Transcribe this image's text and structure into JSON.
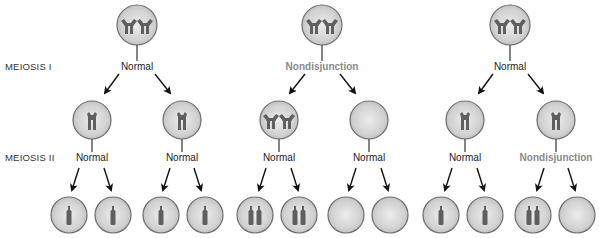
{
  "diagram": {
    "title": "",
    "stage_labels": {
      "meiosis_1": "MEIOSIS I",
      "meiosis_2": "MEIOSIS II"
    },
    "colors": {
      "cell_fill": "#cfcfcf",
      "cell_highlight": "#ececec",
      "cell_border": "#6e6e6e",
      "chromosome": "#5f5f5f",
      "nondisjunction_text": "#8a8a8a",
      "normal_text": "#222222",
      "arrow": "#111111"
    },
    "scenarios": [
      {
        "id": "normal-meiosis",
        "parent": {
          "chromosomes": "2 replicated homologs"
        },
        "meiosis_1": {
          "outcome": "Normal"
        },
        "meiosis_2": [
          {
            "cell": "1 replicated chromosome",
            "outcome": "Normal",
            "gametes": [
              "1 chromosome",
              "1 chromosome"
            ]
          },
          {
            "cell": "1 replicated chromosome",
            "outcome": "Normal",
            "gametes": [
              "1 chromosome",
              "1 chromosome"
            ]
          }
        ]
      },
      {
        "id": "nondisjunction-meiosis-1",
        "parent": {
          "chromosomes": "2 replicated homologs"
        },
        "meiosis_1": {
          "outcome": "Nondisjunction"
        },
        "meiosis_2": [
          {
            "cell": "2 replicated chromosomes",
            "outcome": "Normal",
            "gametes": [
              "2 chromosomes",
              "2 chromosomes"
            ]
          },
          {
            "cell": "0 chromosomes",
            "outcome": "Normal",
            "gametes": [
              "0 chromosomes",
              "0 chromosomes"
            ]
          }
        ]
      },
      {
        "id": "nondisjunction-meiosis-2",
        "parent": {
          "chromosomes": "2 replicated homologs"
        },
        "meiosis_1": {
          "outcome": "Normal"
        },
        "meiosis_2": [
          {
            "cell": "1 replicated chromosome",
            "outcome": "Normal",
            "gametes": [
              "1 chromosome",
              "1 chromosome"
            ]
          },
          {
            "cell": "1 replicated chromosome",
            "outcome": "Nondisjunction",
            "gametes": [
              "2 chromosomes",
              "0 chromosomes"
            ]
          }
        ]
      }
    ]
  }
}
